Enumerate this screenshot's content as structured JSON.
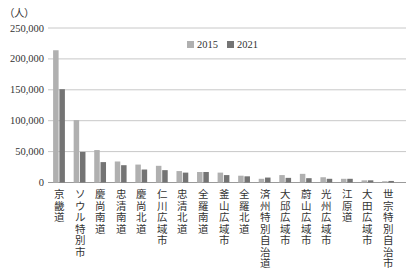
{
  "chart_data": {
    "type": "bar",
    "title": "",
    "unit_label": "（人）",
    "xlabel": "",
    "ylabel": "（人）",
    "ylim": [
      0,
      250000
    ],
    "yticks": [
      0,
      50000,
      100000,
      150000,
      200000,
      250000
    ],
    "ytick_labels": [
      "0",
      "50,000",
      "100,000",
      "150,000",
      "200,000",
      "250,000"
    ],
    "grid": true,
    "legend_position": "top-center",
    "categories": [
      "京畿道",
      "ソウル特別市",
      "慶尚南道",
      "忠清南道",
      "慶尚北道",
      "仁川広域市",
      "忠清北道",
      "全羅南道",
      "釜山広域市",
      "全羅北道",
      "済州特別自治道",
      "大邱広域市",
      "蔚山広域市",
      "光州広域市",
      "江原道",
      "大田広域市",
      "世宗特別自治市"
    ],
    "series": [
      {
        "name": "2015",
        "color": "#b0b0b0",
        "values": [
          214000,
          101000,
          52500,
          34000,
          29000,
          27000,
          18500,
          17000,
          16000,
          11000,
          6000,
          12000,
          14000,
          8500,
          6000,
          3500,
          2000
        ]
      },
      {
        "name": "2021",
        "color": "#747474",
        "values": [
          151000,
          49500,
          33000,
          28000,
          21000,
          20000,
          16000,
          17000,
          12000,
          10000,
          8000,
          7500,
          7000,
          6000,
          6000,
          3500,
          2500
        ]
      }
    ]
  }
}
